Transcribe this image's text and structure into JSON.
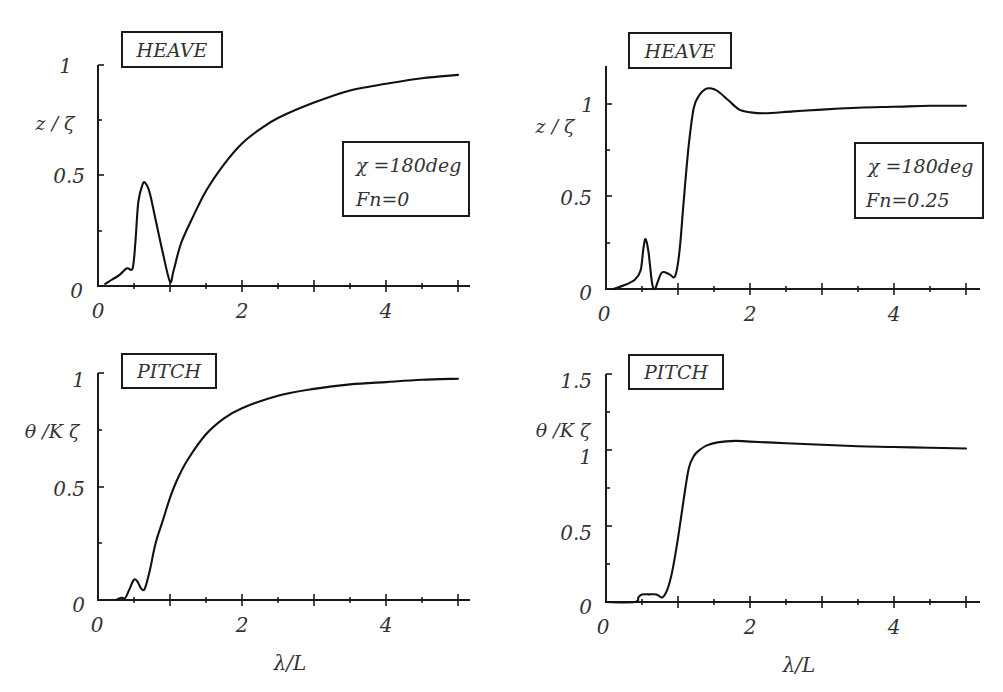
{
  "chart_data": [
    {
      "type": "line",
      "panel": "top-left",
      "title": "HEAVE",
      "xlabel": "",
      "ylabel": "z / ζ",
      "xlim": [
        0,
        5
      ],
      "ylim": [
        0,
        1
      ],
      "x_ticks": [
        "0",
        "2",
        "4"
      ],
      "y_ticks": [
        "0",
        "0.5",
        "1"
      ],
      "grid": false,
      "legend": [
        "χ =180deg",
        "Fn=0"
      ],
      "legend_position": "right-middle",
      "series": [
        {
          "name": "heave Fn=0",
          "x": [
            0.1,
            0.2,
            0.3,
            0.4,
            0.48,
            0.52,
            0.56,
            0.62,
            0.66,
            0.72,
            0.8,
            0.9,
            1.0,
            1.05,
            1.15,
            1.3,
            1.5,
            1.75,
            2.0,
            2.25,
            2.5,
            3.0,
            3.5,
            4.0,
            4.5,
            5.0
          ],
          "y": [
            0.01,
            0.03,
            0.05,
            0.08,
            0.08,
            0.2,
            0.38,
            0.46,
            0.465,
            0.42,
            0.3,
            0.15,
            0.02,
            0.07,
            0.19,
            0.3,
            0.43,
            0.55,
            0.645,
            0.71,
            0.76,
            0.83,
            0.885,
            0.915,
            0.94,
            0.955
          ]
        }
      ]
    },
    {
      "type": "line",
      "panel": "top-right",
      "title": "HEAVE",
      "xlabel": "",
      "ylabel": "z / ζ",
      "xlim": [
        0,
        5
      ],
      "ylim": [
        0,
        1.2
      ],
      "x_ticks": [
        "0",
        "2",
        "4"
      ],
      "y_ticks": [
        "0",
        "0.5",
        "1"
      ],
      "grid": false,
      "legend": [
        "χ =180deg",
        "Fn=0.25"
      ],
      "legend_position": "right-middle",
      "series": [
        {
          "name": "heave Fn=0.25",
          "x": [
            0.1,
            0.25,
            0.4,
            0.48,
            0.52,
            0.55,
            0.59,
            0.64,
            0.68,
            0.72,
            0.78,
            0.88,
            0.96,
            1.02,
            1.08,
            1.15,
            1.22,
            1.3,
            1.38,
            1.45,
            1.55,
            1.7,
            1.85,
            2.0,
            2.2,
            2.6,
            3.0,
            3.5,
            4.0,
            4.5,
            5.0
          ],
          "y": [
            0.0,
            0.02,
            0.05,
            0.1,
            0.22,
            0.27,
            0.2,
            0.03,
            0.0,
            0.04,
            0.09,
            0.08,
            0.07,
            0.2,
            0.48,
            0.78,
            0.98,
            1.05,
            1.08,
            1.085,
            1.07,
            1.02,
            0.97,
            0.955,
            0.95,
            0.96,
            0.97,
            0.98,
            0.985,
            0.99,
            0.99
          ]
        }
      ]
    },
    {
      "type": "line",
      "panel": "bottom-left",
      "title": "PITCH",
      "xlabel": "λ/L",
      "ylabel": "θ /K ζ",
      "xlim": [
        0,
        5
      ],
      "ylim": [
        0,
        1
      ],
      "x_ticks": [
        "0",
        "2",
        "4"
      ],
      "y_ticks": [
        "0",
        "0.5",
        "1"
      ],
      "grid": false,
      "legend": [],
      "series": [
        {
          "name": "pitch Fn=0",
          "x": [
            0.25,
            0.32,
            0.38,
            0.44,
            0.5,
            0.55,
            0.6,
            0.65,
            0.72,
            0.8,
            0.9,
            1.0,
            1.1,
            1.25,
            1.5,
            1.75,
            2.0,
            2.5,
            3.0,
            3.5,
            4.0,
            4.5,
            5.0
          ],
          "y": [
            0.0,
            0.01,
            0.01,
            0.05,
            0.09,
            0.08,
            0.05,
            0.05,
            0.13,
            0.25,
            0.35,
            0.45,
            0.53,
            0.62,
            0.73,
            0.8,
            0.845,
            0.9,
            0.93,
            0.95,
            0.96,
            0.97,
            0.975
          ]
        }
      ]
    },
    {
      "type": "line",
      "panel": "bottom-right",
      "title": "PITCH",
      "xlabel": "λ/L",
      "ylabel": "θ /K ζ",
      "xlim": [
        0,
        5
      ],
      "ylim": [
        0,
        1.5
      ],
      "x_ticks": [
        "0",
        "2",
        "4"
      ],
      "y_ticks": [
        "0",
        "0.5",
        "1",
        "1.5"
      ],
      "grid": false,
      "legend": [],
      "series": [
        {
          "name": "pitch Fn=0.25",
          "x": [
            0.0,
            0.4,
            0.45,
            0.5,
            0.6,
            0.7,
            0.78,
            0.85,
            0.92,
            1.0,
            1.08,
            1.15,
            1.22,
            1.3,
            1.4,
            1.55,
            1.8,
            2.0,
            2.5,
            3.0,
            3.5,
            4.0,
            4.5,
            5.0
          ],
          "y": [
            0.0,
            0.0,
            0.03,
            0.05,
            0.05,
            0.05,
            0.03,
            0.08,
            0.2,
            0.42,
            0.68,
            0.88,
            0.96,
            1.0,
            1.03,
            1.05,
            1.06,
            1.055,
            1.045,
            1.035,
            1.025,
            1.02,
            1.015,
            1.01
          ]
        }
      ]
    }
  ],
  "panels": {
    "top_left": {
      "title": "HEAVE",
      "ylabel": "z / ζ",
      "legend_line1": "χ =180deg",
      "legend_line2": "Fn=0"
    },
    "top_right": {
      "title": "HEAVE",
      "ylabel": "z / ζ",
      "legend_line1": "χ =180deg",
      "legend_line2": "Fn=0.25"
    },
    "bottom_left": {
      "title": "PITCH",
      "ylabel": "θ /K ζ",
      "xlabel": "λ/L"
    },
    "bottom_right": {
      "title": "PITCH",
      "ylabel": "θ /K ζ",
      "xlabel": "λ/L"
    }
  },
  "ticks": {
    "x": [
      "0",
      "2",
      "4"
    ],
    "y_unit": [
      "0",
      "0.5",
      "1"
    ],
    "y_pitch_right": [
      "0",
      "0.5",
      "1",
      "1.5"
    ]
  }
}
